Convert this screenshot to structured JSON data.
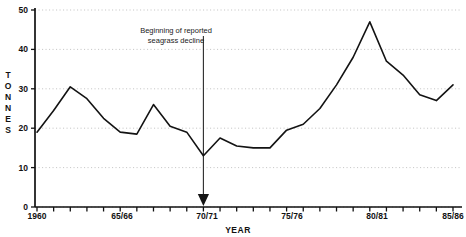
{
  "figure": {
    "clipped_title": "",
    "annotation": {
      "line1": "Beginning of reported",
      "line2": "seagrass decline",
      "points_to_year": "70/71"
    }
  },
  "chart_data": {
    "type": "line",
    "title": "",
    "xlabel": "YEAR",
    "ylabel": "TONNES",
    "ylim": [
      0,
      50
    ],
    "ytick_values": [
      0,
      10,
      20,
      30,
      40,
      50
    ],
    "ytick_labels": [
      "0",
      "10",
      "20",
      "30",
      "40",
      "50"
    ],
    "xlim": [
      "1960",
      "85/86"
    ],
    "xtick_labels": [
      "1960",
      "65/66",
      "70/71",
      "75/76",
      "80/81",
      "85/86"
    ],
    "xtick_label_years": [
      1960,
      1965,
      1970,
      1975,
      1980,
      1985
    ],
    "minor_ticks_per_interval": 5,
    "grid": "horizontal-dotted",
    "legend": "none",
    "line_color": "#131313",
    "grid_color": "#b9b9b9",
    "axis_color": "#111111",
    "x": [
      1960,
      1961,
      1962,
      1963,
      1964,
      1965,
      1966,
      1967,
      1968,
      1969,
      1970,
      1971,
      1972,
      1973,
      1974,
      1975,
      1976,
      1977,
      1978,
      1979,
      1980,
      1981,
      1982,
      1983,
      1984,
      1985
    ],
    "x_labels": [
      "1960",
      "61/62",
      "62/63",
      "63/64",
      "64/65",
      "65/66",
      "66/67",
      "67/68",
      "68/69",
      "69/70",
      "70/71",
      "71/72",
      "72/73",
      "73/74",
      "74/75",
      "75/76",
      "76/77",
      "77/78",
      "78/79",
      "79/80",
      "80/81",
      "81/82",
      "82/83",
      "83/84",
      "84/85",
      "85/86"
    ],
    "values": [
      19.0,
      24.5,
      30.5,
      27.5,
      22.5,
      19.0,
      18.5,
      26.0,
      20.5,
      19.0,
      13.0,
      17.5,
      15.5,
      15.0,
      15.0,
      19.5,
      21.0,
      25.0,
      31.0,
      38.0,
      47.0,
      37.0,
      33.5,
      28.5,
      27.0,
      31.0
    ],
    "annotations": [
      {
        "text": "Beginning of reported seagrass decline",
        "at_year": 1970,
        "style": "down-arrow"
      }
    ]
  }
}
